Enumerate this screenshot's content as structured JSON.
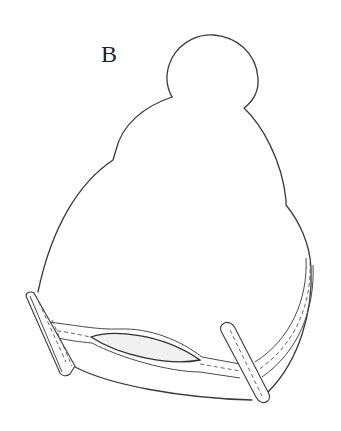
{
  "figure": {
    "label": "B",
    "colors": {
      "line": "#3a3a3a",
      "background": "#ffffff",
      "opening_fill": "#f1f1f1"
    }
  }
}
